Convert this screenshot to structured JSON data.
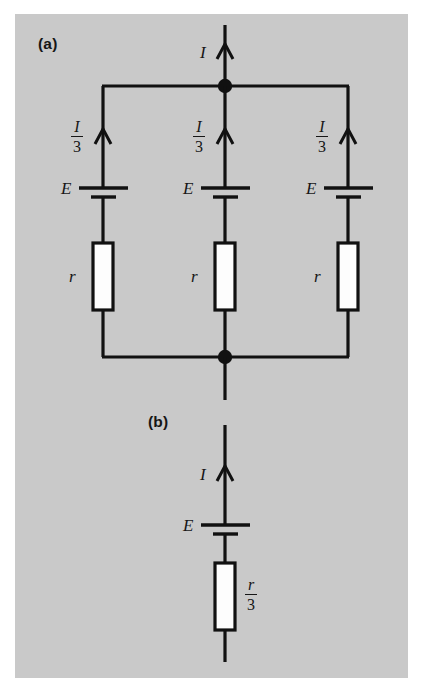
{
  "figure": {
    "type": "circuit-diagram",
    "background_color": "#c9c9c9",
    "page_color": "#ffffff",
    "line_color": "#111111",
    "resistor_fill": "#fdfdfd"
  },
  "panels": {
    "a": {
      "tag": "(a)",
      "total_current_label": "I",
      "branches": [
        {
          "current_numerator": "I",
          "current_denominator": "3",
          "emf_label": "E",
          "resistance_label": "r"
        },
        {
          "current_numerator": "I",
          "current_denominator": "3",
          "emf_label": "E",
          "resistance_label": "r"
        },
        {
          "current_numerator": "I",
          "current_denominator": "3",
          "emf_label": "E",
          "resistance_label": "r"
        }
      ]
    },
    "b": {
      "tag": "(b)",
      "current_label": "I",
      "emf_label": "E",
      "resistance_numerator": "r",
      "resistance_denominator": "3"
    }
  }
}
